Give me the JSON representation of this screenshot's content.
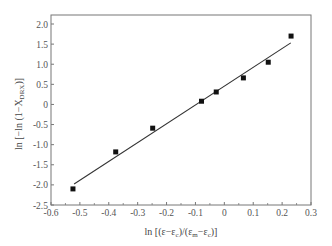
{
  "chart_data": {
    "type": "scatter",
    "title": "",
    "xlabel": "ln [(ε−εc)/(εm−εc)]",
    "ylabel": "ln [−ln (1−XDRX)]",
    "xlim": [
      -0.6,
      0.3
    ],
    "ylim": [
      -2.5,
      2.2
    ],
    "x_ticks": [
      -0.6,
      -0.5,
      -0.4,
      -0.3,
      -0.2,
      -0.1,
      0,
      0.1,
      0.2,
      0.3
    ],
    "x_tick_labels": [
      "-0.6",
      "-0.5",
      "-0.4",
      "-0.3",
      "-0.2",
      "-0.1",
      "0",
      "0.1",
      "0.2",
      "0.3"
    ],
    "y_ticks": [
      -2.5,
      -2.0,
      -1.5,
      -1.0,
      -0.5,
      0,
      0.5,
      1.0,
      1.5,
      2.0
    ],
    "y_tick_labels": [
      "-2.5",
      "-2.0",
      "-1.5",
      "-1.0",
      "-0.5",
      "0",
      "0.5",
      "1.0",
      "1.5",
      "2.0"
    ],
    "grid": false,
    "legend": null,
    "series": [
      {
        "name": "data",
        "marker": "square",
        "x": [
          -0.524,
          -0.376,
          -0.248,
          -0.079,
          -0.028,
          0.066,
          0.152,
          0.231
        ],
        "y": [
          -2.1,
          -1.18,
          -0.59,
          0.08,
          0.31,
          0.66,
          1.05,
          1.7
        ]
      },
      {
        "name": "linear fit",
        "type": "line",
        "x": [
          -0.52,
          0.23
        ],
        "y": [
          -1.98,
          1.53
        ]
      }
    ]
  },
  "labels": {
    "x_main": "ln [(ε−ε",
    "x_sub1": "c",
    "x_mid": ")/(ε",
    "x_sub2": "m",
    "x_mid2": "−ε",
    "x_sub3": "c",
    "x_end": ")]",
    "y_main": "ln [−ln (1−X",
    "y_sub": "DRX",
    "y_end": ")]"
  }
}
